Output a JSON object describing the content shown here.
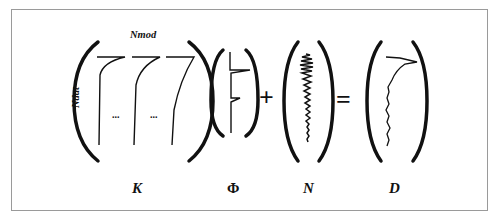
{
  "diagram": {
    "equation": "K Φ + N = D",
    "labels": {
      "K": "K",
      "Phi": "Φ",
      "N": "N",
      "D": "D",
      "cols": "Nmod",
      "rows": "Ndat"
    },
    "operators": {
      "plus": "+",
      "equals": "="
    },
    "ellipsis": "..."
  }
}
